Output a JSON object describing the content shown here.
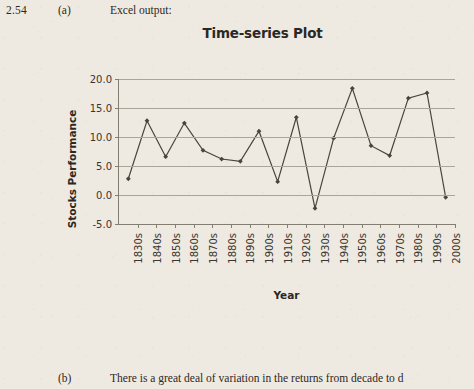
{
  "page": {
    "question_number": "2.54",
    "part_a_label": "(a)",
    "part_a_text": "Excel output:",
    "part_b_label": "(b)",
    "part_b_text": "There is a great deal of variation in the returns from decade to d"
  },
  "colors": {
    "paper_background": "#efeae1",
    "text": "#2b2824",
    "series_line": "#4a443b",
    "gridline": "#aaa49a",
    "axis": "#847e72",
    "frame_border": "#8a8478"
  },
  "chart_data": {
    "type": "line",
    "title": "Time-series Plot",
    "xlabel": "Year",
    "ylabel": "Stocks Performance",
    "ylim": [
      -5.0,
      20.0
    ],
    "ytick_labels": [
      "20.0",
      "15.0",
      "10.0",
      "5.0",
      "0.0",
      "-5.0"
    ],
    "ytick_values": [
      20.0,
      15.0,
      10.0,
      5.0,
      0.0,
      -5.0
    ],
    "grid": true,
    "legend": "none",
    "marker": "diamond",
    "categories": [
      "1830s",
      "1840s",
      "1850s",
      "1860s",
      "1870s",
      "1880s",
      "1890s",
      "1900s",
      "1910s",
      "1920s",
      "1930s",
      "1940s",
      "1950s",
      "1960s",
      "1970s",
      "1980s",
      "1990s",
      "2000s"
    ],
    "values": [
      2.8,
      12.8,
      6.6,
      12.4,
      7.7,
      6.2,
      5.8,
      11.0,
      2.3,
      13.4,
      -2.3,
      9.8,
      18.4,
      8.5,
      6.8,
      16.7,
      17.6,
      -0.4
    ]
  }
}
